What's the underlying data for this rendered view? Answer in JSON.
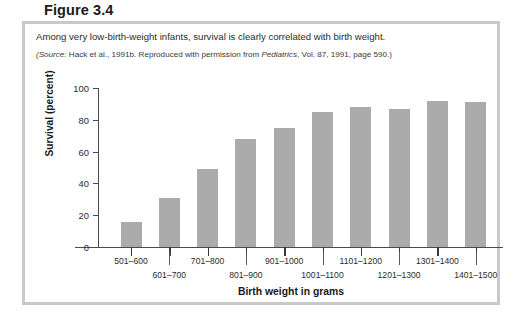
{
  "figure": {
    "label": "Figure 3.4",
    "caption": "Among very low-birth-weight infants, survival is clearly correlated with birth weight.",
    "source_prefix": "(Source:",
    "source_text_1": " Hack et al., 1991b. Reproduced with permission from ",
    "source_italic": "Pediatrics",
    "source_text_2": ", Vol. 87, 1991, page 590.)",
    "frame_color": "#c9c9c9"
  },
  "chart_data": {
    "type": "bar",
    "title": "",
    "xlabel": "Birth weight in grams",
    "ylabel": "Survival (percent)",
    "categories": [
      "501–600",
      "601–700",
      "701–800",
      "801–900",
      "901–1000",
      "1001–1100",
      "1101–1200",
      "1201–1300",
      "1301–1400",
      "1401–1500"
    ],
    "values": [
      16,
      31,
      49,
      68,
      75,
      85,
      88,
      87,
      92,
      91
    ],
    "ylim": [
      0,
      100
    ],
    "yticks": [
      0,
      20,
      40,
      60,
      80,
      100
    ],
    "ytick_labels": [
      "0",
      "20",
      "40",
      "60",
      "80",
      "100"
    ],
    "grid": false,
    "legend": false,
    "bar_color": "#ababab",
    "axis_color": "#4a4a4a"
  }
}
